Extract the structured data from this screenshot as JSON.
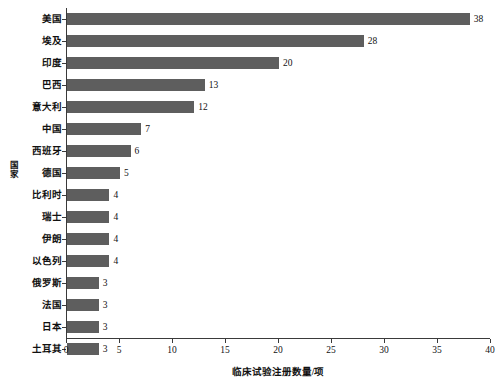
{
  "chart_data": {
    "type": "bar",
    "orientation": "horizontal",
    "title": "",
    "xlabel": "临床试验注册数量/项",
    "ylabel": "国家",
    "categories": [
      "美国",
      "埃及",
      "印度",
      "巴西",
      "意大利",
      "中国",
      "西班牙",
      "德国",
      "比利时",
      "瑞士",
      "伊朗",
      "以色列",
      "俄罗斯",
      "法国",
      "日本",
      "土耳其"
    ],
    "values": [
      38,
      28,
      20,
      13,
      12,
      7,
      6,
      5,
      4,
      4,
      4,
      4,
      3,
      3,
      3,
      3
    ],
    "data_labels": [
      "38",
      "28",
      "20",
      "13",
      "12",
      "7",
      "6",
      "5",
      "4",
      "4",
      "4",
      "4",
      "3",
      "3",
      "3",
      "3"
    ],
    "xlim": [
      0,
      40
    ],
    "xticks": [
      0,
      5,
      10,
      15,
      20,
      25,
      30,
      35,
      40
    ],
    "xtick_labels": [
      "0",
      "5",
      "10",
      "15",
      "20",
      "25",
      "30",
      "35",
      "40"
    ],
    "grid": false,
    "legend": null,
    "bar_color": "#5e5e5e",
    "axis_color": "#3a3a3a",
    "background_color": "#ffffff"
  }
}
